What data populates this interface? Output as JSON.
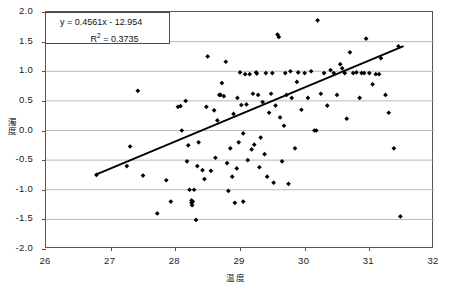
{
  "chart_data": {
    "type": "scatter",
    "title": "",
    "xlabel": "温度",
    "ylabel": "濁度",
    "xlim": [
      26,
      32
    ],
    "ylim": [
      -2.0,
      2.0
    ],
    "xticks": [
      26,
      27,
      28,
      29,
      30,
      31,
      32
    ],
    "yticks": [
      -2.0,
      -1.5,
      -1.0,
      -0.5,
      0.0,
      0.5,
      1.0,
      1.5,
      2.0
    ],
    "xtick_labels": [
      "26",
      "27",
      "28",
      "29",
      "30",
      "31",
      "32"
    ],
    "ytick_labels": [
      "-2.0",
      "-1.5",
      "-1.0",
      "-0.5",
      "0.0",
      "0.5",
      "1.0",
      "1.5",
      "2.0"
    ],
    "grid": "horizontal",
    "legend": "none",
    "marker": "diamond",
    "marker_color": "#000000",
    "annotations": {
      "equation": "y = 0.4561x - 12.954",
      "r_squared_label": "R",
      "r_squared_exponent": "2",
      "r_squared_value": " = 0.3735"
    },
    "trendline": {
      "type": "linear",
      "slope": 0.4561,
      "intercept": -12.954,
      "r_squared": 0.3735,
      "color": "#000000",
      "x_start": 26.78,
      "y_start": -0.74,
      "x_end": 31.52,
      "y_end": 1.42
    },
    "points": [
      [
        26.78,
        -0.75
      ],
      [
        27.25,
        -0.6
      ],
      [
        27.3,
        -0.27
      ],
      [
        27.42,
        0.67
      ],
      [
        27.5,
        -0.76
      ],
      [
        27.72,
        -1.4
      ],
      [
        27.86,
        -0.84
      ],
      [
        27.93,
        -1.2
      ],
      [
        28.04,
        0.4
      ],
      [
        28.08,
        0.41
      ],
      [
        28.1,
        0.0
      ],
      [
        28.16,
        0.5
      ],
      [
        28.18,
        -0.52
      ],
      [
        28.2,
        -0.25
      ],
      [
        28.22,
        -1.0
      ],
      [
        28.25,
        -1.18
      ],
      [
        28.25,
        -1.22
      ],
      [
        28.26,
        -1.26
      ],
      [
        28.27,
        -1.2
      ],
      [
        28.29,
        -1.0
      ],
      [
        28.32,
        -1.51
      ],
      [
        28.34,
        -0.6
      ],
      [
        28.36,
        -0.2
      ],
      [
        28.42,
        -0.67
      ],
      [
        28.45,
        -0.82
      ],
      [
        28.48,
        0.4
      ],
      [
        28.5,
        1.25
      ],
      [
        28.55,
        -0.68
      ],
      [
        28.6,
        0.34
      ],
      [
        28.62,
        -0.46
      ],
      [
        28.65,
        0.17
      ],
      [
        28.68,
        0.6
      ],
      [
        28.7,
        0.6
      ],
      [
        28.72,
        0.8
      ],
      [
        28.75,
        0.58
      ],
      [
        28.78,
        1.16
      ],
      [
        28.8,
        -0.55
      ],
      [
        28.82,
        -1.02
      ],
      [
        28.85,
        -0.3
      ],
      [
        28.88,
        -0.78
      ],
      [
        28.9,
        0.28
      ],
      [
        28.92,
        -1.22
      ],
      [
        28.95,
        -0.64
      ],
      [
        28.96,
        0.55
      ],
      [
        28.98,
        -0.2
      ],
      [
        29.0,
        0.98
      ],
      [
        29.02,
        0.43
      ],
      [
        29.05,
        -0.05
      ],
      [
        29.08,
        0.95
      ],
      [
        29.1,
        0.44
      ],
      [
        29.12,
        -0.5
      ],
      [
        29.15,
        0.95
      ],
      [
        29.18,
        -0.32
      ],
      [
        29.2,
        0.62
      ],
      [
        29.22,
        -0.24
      ],
      [
        29.25,
        0.98
      ],
      [
        29.26,
        0.96
      ],
      [
        29.28,
        0.6
      ],
      [
        29.3,
        -0.62
      ],
      [
        29.32,
        -0.12
      ],
      [
        29.35,
        0.48
      ],
      [
        29.38,
        -0.4
      ],
      [
        29.4,
        0.97
      ],
      [
        29.42,
        -0.78
      ],
      [
        29.45,
        0.3
      ],
      [
        29.48,
        0.62
      ],
      [
        29.5,
        0.97
      ],
      [
        29.52,
        -0.88
      ],
      [
        29.55,
        0.42
      ],
      [
        29.58,
        1.62
      ],
      [
        29.6,
        1.58
      ],
      [
        29.62,
        0.22
      ],
      [
        29.65,
        -0.52
      ],
      [
        29.68,
        0.08
      ],
      [
        29.7,
        0.97
      ],
      [
        29.72,
        0.6
      ],
      [
        29.75,
        -0.9
      ],
      [
        29.78,
        1.0
      ],
      [
        29.8,
        0.55
      ],
      [
        29.85,
        -0.3
      ],
      [
        29.88,
        0.82
      ],
      [
        29.9,
        0.98
      ],
      [
        29.95,
        0.35
      ],
      [
        30.0,
        0.97
      ],
      [
        30.05,
        0.55
      ],
      [
        30.1,
        1.0
      ],
      [
        30.15,
        0.0
      ],
      [
        30.2,
        1.86
      ],
      [
        30.25,
        0.62
      ],
      [
        30.3,
        0.97
      ],
      [
        30.35,
        0.42
      ],
      [
        30.4,
        1.02
      ],
      [
        30.45,
        0.97
      ],
      [
        30.5,
        0.6
      ],
      [
        30.55,
        1.12
      ],
      [
        30.58,
        1.05
      ],
      [
        30.62,
        0.97
      ],
      [
        30.65,
        0.2
      ],
      [
        30.7,
        1.32
      ],
      [
        30.75,
        0.97
      ],
      [
        30.8,
        0.98
      ],
      [
        30.85,
        0.55
      ],
      [
        30.88,
        0.97
      ],
      [
        30.92,
        0.97
      ],
      [
        30.95,
        1.55
      ],
      [
        31.0,
        0.97
      ],
      [
        31.05,
        0.78
      ],
      [
        31.1,
        0.95
      ],
      [
        31.15,
        0.95
      ],
      [
        31.18,
        1.22
      ],
      [
        31.25,
        0.6
      ],
      [
        31.3,
        0.3
      ],
      [
        31.38,
        -0.3
      ],
      [
        31.45,
        1.42
      ],
      [
        31.48,
        -1.45
      ],
      [
        30.18,
        0.0
      ],
      [
        29.05,
        -1.2
      ]
    ]
  }
}
